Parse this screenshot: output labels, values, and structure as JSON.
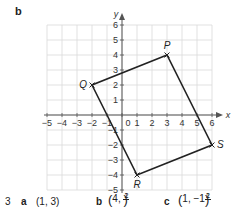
{
  "part_label": "b",
  "chart_data": {
    "type": "scatter",
    "title": "",
    "xlabel": "x",
    "ylabel": "y",
    "xlim": [
      -5,
      6
    ],
    "ylim": [
      -5,
      6
    ],
    "grid": true,
    "x_ticks": [
      -5,
      -4,
      -3,
      -2,
      -1,
      0,
      1,
      2,
      3,
      4,
      5,
      6
    ],
    "y_ticks": [
      -5,
      -4,
      -3,
      -2,
      -1,
      1,
      2,
      3,
      4,
      5,
      6
    ],
    "points": [
      {
        "label": "P",
        "x": 3,
        "y": 4
      },
      {
        "label": "Q",
        "x": -2,
        "y": 2
      },
      {
        "label": "R",
        "x": 1,
        "y": -4
      },
      {
        "label": "S",
        "x": 6,
        "y": -2
      }
    ],
    "polygon": [
      "P",
      "Q",
      "R",
      "S"
    ],
    "colors": {
      "grid": "#d9d9d9",
      "axis": "#555555",
      "shape": "#222222"
    }
  },
  "answers": {
    "question_number": "3",
    "a": {
      "letter": "a",
      "value": "(1, 3)"
    },
    "b": {
      "letter": "b",
      "x": "4",
      "frac_num": "1",
      "frac_den": "2"
    },
    "c": {
      "letter": "c",
      "x": "1",
      "y_whole": "−1",
      "frac_num": "1",
      "frac_den": "2"
    }
  }
}
